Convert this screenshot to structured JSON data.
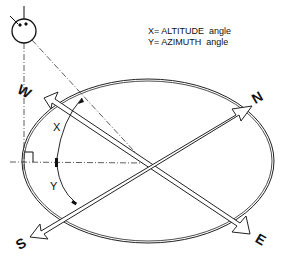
{
  "legend": {
    "line1": "X= ALTITUDE  angle",
    "line2": "Y= AZIMUTH  angle"
  },
  "labels": {
    "x_angle": "X",
    "y_angle": "Y",
    "north": "N",
    "south": "S",
    "east": "E",
    "west": "W"
  },
  "colors": {
    "ink": "#111111",
    "background": "#ffffff"
  }
}
